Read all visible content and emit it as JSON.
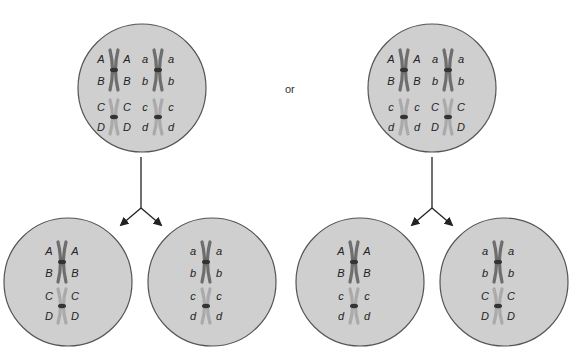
{
  "connector_label": "or",
  "colors": {
    "cell_fill": "#cfcfcf",
    "cell_stroke": "#555555",
    "chrom_dark": "#6e6e6e",
    "chrom_light": "#aaaaaa",
    "centromere": "#333333",
    "arrow": "#222222"
  },
  "parent_cells": [
    {
      "name": "parent-cell-left",
      "pairs": [
        {
          "left": [
            "A",
            "B"
          ],
          "right": [
            "A",
            "B"
          ],
          "shade": "dark"
        },
        {
          "left": [
            "a",
            "b"
          ],
          "right": [
            "a",
            "b"
          ],
          "shade": "dark"
        },
        {
          "left": [
            "C",
            "D"
          ],
          "right": [
            "C",
            "D"
          ],
          "shade": "light"
        },
        {
          "left": [
            "c",
            "d"
          ],
          "right": [
            "c",
            "d"
          ],
          "shade": "light"
        }
      ]
    },
    {
      "name": "parent-cell-right",
      "pairs": [
        {
          "left": [
            "A",
            "B"
          ],
          "right": [
            "A",
            "B"
          ],
          "shade": "dark"
        },
        {
          "left": [
            "a",
            "b"
          ],
          "right": [
            "a",
            "b"
          ],
          "shade": "dark"
        },
        {
          "left": [
            "c",
            "d"
          ],
          "right": [
            "c",
            "d"
          ],
          "shade": "light"
        },
        {
          "left": [
            "C",
            "D"
          ],
          "right": [
            "C",
            "D"
          ],
          "shade": "light"
        }
      ]
    }
  ],
  "daughter_cells": [
    {
      "name": "daughter-cell-1",
      "top": {
        "left": [
          "A",
          "B"
        ],
        "right": [
          "A",
          "B"
        ]
      },
      "bottom": {
        "left": [
          "C",
          "D"
        ],
        "right": [
          "C",
          "D"
        ]
      }
    },
    {
      "name": "daughter-cell-2",
      "top": {
        "left": [
          "a",
          "b"
        ],
        "right": [
          "a",
          "b"
        ]
      },
      "bottom": {
        "left": [
          "c",
          "d"
        ],
        "right": [
          "c",
          "d"
        ]
      }
    },
    {
      "name": "daughter-cell-3",
      "top": {
        "left": [
          "A",
          "B"
        ],
        "right": [
          "A",
          "B"
        ]
      },
      "bottom": {
        "left": [
          "c",
          "d"
        ],
        "right": [
          "c",
          "d"
        ]
      }
    },
    {
      "name": "daughter-cell-4",
      "top": {
        "left": [
          "a",
          "b"
        ],
        "right": [
          "a",
          "b"
        ]
      },
      "bottom": {
        "left": [
          "C",
          "D"
        ],
        "right": [
          "C",
          "D"
        ]
      }
    }
  ]
}
